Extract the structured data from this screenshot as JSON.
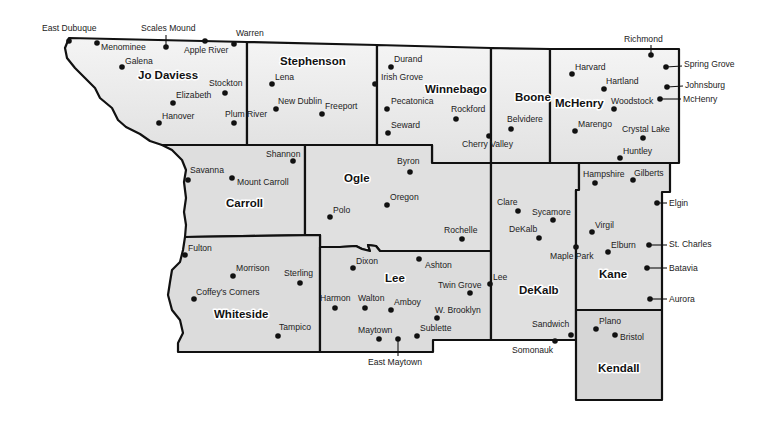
{
  "map": {
    "colors": {
      "background": "#ffffff",
      "fill_light": "#ececec",
      "fill_mid": "#dcdcdc",
      "border": "#111111",
      "text": "#222222"
    },
    "counties": [
      {
        "name": "Jo Daviess",
        "label_x": 138,
        "label_y": 79
      },
      {
        "name": "Stephenson",
        "label_x": 280,
        "label_y": 65
      },
      {
        "name": "Winnebago",
        "label_x": 425,
        "label_y": 93
      },
      {
        "name": "Boone",
        "label_x": 515,
        "label_y": 101
      },
      {
        "name": "McHenry",
        "label_x": 555,
        "label_y": 107
      },
      {
        "name": "Carroll",
        "label_x": 226,
        "label_y": 207
      },
      {
        "name": "Ogle",
        "label_x": 344,
        "label_y": 182
      },
      {
        "name": "Whiteside",
        "label_x": 214,
        "label_y": 318
      },
      {
        "name": "Lee",
        "label_x": 385,
        "label_y": 282
      },
      {
        "name": "DeKalb",
        "label_x": 519,
        "label_y": 294
      },
      {
        "name": "Kane",
        "label_x": 599,
        "label_y": 278
      },
      {
        "name": "Kendall",
        "label_x": 598,
        "label_y": 372
      }
    ],
    "cities": [
      {
        "name": "East Dubuque",
        "dot_x": 69,
        "dot_y": 41,
        "label_x": 42,
        "label_y": 31,
        "leader": true
      },
      {
        "name": "Menominee",
        "dot_x": 97,
        "dot_y": 43,
        "label_x": 101,
        "label_y": 50
      },
      {
        "name": "Scales Mound",
        "dot_x": 166,
        "dot_y": 47,
        "label_x": 141,
        "label_y": 31,
        "leader": true
      },
      {
        "name": "Apple River",
        "dot_x": 205,
        "dot_y": 41,
        "label_x": 184,
        "label_y": 53
      },
      {
        "name": "Warren",
        "dot_x": 234,
        "dot_y": 44,
        "label_x": 236,
        "label_y": 36
      },
      {
        "name": "Galena",
        "dot_x": 122,
        "dot_y": 67,
        "label_x": 125,
        "label_y": 64
      },
      {
        "name": "Stockton",
        "dot_x": 225,
        "dot_y": 93,
        "label_x": 209,
        "label_y": 86
      },
      {
        "name": "Elizabeth",
        "dot_x": 173,
        "dot_y": 103,
        "label_x": 176,
        "label_y": 98
      },
      {
        "name": "Hanover",
        "dot_x": 159,
        "dot_y": 123,
        "label_x": 162,
        "label_y": 119
      },
      {
        "name": "Plum River",
        "dot_x": 234,
        "dot_y": 123,
        "label_x": 225,
        "label_y": 117
      },
      {
        "name": "Lena",
        "dot_x": 272,
        "dot_y": 84,
        "label_x": 275,
        "label_y": 80
      },
      {
        "name": "New Dublin",
        "dot_x": 276,
        "dot_y": 109,
        "label_x": 278,
        "label_y": 104
      },
      {
        "name": "Freeport",
        "dot_x": 322,
        "dot_y": 114,
        "label_x": 325,
        "label_y": 109
      },
      {
        "name": "Durand",
        "dot_x": 391,
        "dot_y": 67,
        "label_x": 394,
        "label_y": 62
      },
      {
        "name": "Irish Grove",
        "dot_x": 375,
        "dot_y": 84,
        "label_x": 381,
        "label_y": 80
      },
      {
        "name": "Pecatonica",
        "dot_x": 387,
        "dot_y": 109,
        "label_x": 391,
        "label_y": 104
      },
      {
        "name": "Rockford",
        "dot_x": 456,
        "dot_y": 119,
        "label_x": 451,
        "label_y": 112
      },
      {
        "name": "Seward",
        "dot_x": 388,
        "dot_y": 133,
        "label_x": 391,
        "label_y": 128
      },
      {
        "name": "Cherry Valley",
        "dot_x": 489,
        "dot_y": 136,
        "label_x": 462,
        "label_y": 147
      },
      {
        "name": "Belvidere",
        "dot_x": 511,
        "dot_y": 129,
        "label_x": 507,
        "label_y": 122
      },
      {
        "name": "Richmond",
        "dot_x": 651,
        "dot_y": 55,
        "label_x": 624,
        "label_y": 42,
        "leader": true
      },
      {
        "name": "Harvard",
        "dot_x": 572,
        "dot_y": 74,
        "label_x": 575,
        "label_y": 70
      },
      {
        "name": "Spring Grove",
        "dot_x": 666,
        "dot_y": 67,
        "label_x": 684,
        "label_y": 67,
        "leader": true
      },
      {
        "name": "Hartland",
        "dot_x": 604,
        "dot_y": 89,
        "label_x": 606,
        "label_y": 84
      },
      {
        "name": "Johnsburg",
        "dot_x": 667,
        "dot_y": 87,
        "label_x": 685,
        "label_y": 88,
        "leader": true
      },
      {
        "name": "Woodstock",
        "dot_x": 614,
        "dot_y": 109,
        "label_x": 611,
        "label_y": 104
      },
      {
        "name": "McHenry",
        "dot_x": 660,
        "dot_y": 99,
        "label_x": 683,
        "label_y": 102,
        "leader": true
      },
      {
        "name": "Marengo",
        "dot_x": 575,
        "dot_y": 131,
        "label_x": 578,
        "label_y": 127
      },
      {
        "name": "Crystal Lake",
        "dot_x": 643,
        "dot_y": 138,
        "label_x": 622,
        "label_y": 132
      },
      {
        "name": "Huntley",
        "dot_x": 620,
        "dot_y": 158,
        "label_x": 623,
        "label_y": 154
      },
      {
        "name": "Shannon",
        "dot_x": 293,
        "dot_y": 161,
        "label_x": 266,
        "label_y": 157
      },
      {
        "name": "Savanna",
        "dot_x": 188,
        "dot_y": 180,
        "label_x": 190,
        "label_y": 173
      },
      {
        "name": "Mount Carroll",
        "dot_x": 232,
        "dot_y": 178,
        "label_x": 237,
        "label_y": 185
      },
      {
        "name": "Byron",
        "dot_x": 410,
        "dot_y": 172,
        "label_x": 397,
        "label_y": 164
      },
      {
        "name": "Oregon",
        "dot_x": 387,
        "dot_y": 205,
        "label_x": 390,
        "label_y": 200
      },
      {
        "name": "Polo",
        "dot_x": 330,
        "dot_y": 217,
        "label_x": 333,
        "label_y": 213
      },
      {
        "name": "Rochelle",
        "dot_x": 462,
        "dot_y": 239,
        "label_x": 444,
        "label_y": 233
      },
      {
        "name": "Clare",
        "dot_x": 518,
        "dot_y": 211,
        "label_x": 497,
        "label_y": 205
      },
      {
        "name": "Sycamore",
        "dot_x": 553,
        "dot_y": 220,
        "label_x": 532,
        "label_y": 215
      },
      {
        "name": "DeKalb",
        "dot_x": 539,
        "dot_y": 238,
        "label_x": 509,
        "label_y": 232
      },
      {
        "name": "Maple Park",
        "dot_x": 576,
        "dot_y": 247,
        "label_x": 550,
        "label_y": 259
      },
      {
        "name": "Hampshire",
        "dot_x": 595,
        "dot_y": 183,
        "label_x": 583,
        "label_y": 177
      },
      {
        "name": "Gilberts",
        "dot_x": 633,
        "dot_y": 180,
        "label_x": 634,
        "label_y": 176
      },
      {
        "name": "Elgin",
        "dot_x": 657,
        "dot_y": 203,
        "label_x": 669,
        "label_y": 206,
        "leader": true
      },
      {
        "name": "Virgil",
        "dot_x": 592,
        "dot_y": 232,
        "label_x": 595,
        "label_y": 228
      },
      {
        "name": "Elburn",
        "dot_x": 608,
        "dot_y": 252,
        "label_x": 611,
        "label_y": 248
      },
      {
        "name": "St. Charles",
        "dot_x": 649,
        "dot_y": 245,
        "label_x": 669,
        "label_y": 247,
        "leader": true
      },
      {
        "name": "Batavia",
        "dot_x": 647,
        "dot_y": 268,
        "label_x": 669,
        "label_y": 271,
        "leader": true
      },
      {
        "name": "Aurora",
        "dot_x": 650,
        "dot_y": 299,
        "label_x": 669,
        "label_y": 302,
        "leader": true
      },
      {
        "name": "Fulton",
        "dot_x": 185,
        "dot_y": 255,
        "label_x": 188,
        "label_y": 251
      },
      {
        "name": "Morrison",
        "dot_x": 233,
        "dot_y": 276,
        "label_x": 236,
        "label_y": 271
      },
      {
        "name": "Sterling",
        "dot_x": 300,
        "dot_y": 283,
        "label_x": 284,
        "label_y": 276
      },
      {
        "name": "Coffey's Corners",
        "dot_x": 194,
        "dot_y": 299,
        "label_x": 196,
        "label_y": 295
      },
      {
        "name": "Tampico",
        "dot_x": 278,
        "dot_y": 336,
        "label_x": 279,
        "label_y": 330
      },
      {
        "name": "Dixon",
        "dot_x": 353,
        "dot_y": 268,
        "label_x": 356,
        "label_y": 264
      },
      {
        "name": "Ashton",
        "dot_x": 419,
        "dot_y": 259,
        "label_x": 425,
        "label_y": 268
      },
      {
        "name": "Harmon",
        "dot_x": 335,
        "dot_y": 308,
        "label_x": 320,
        "label_y": 301
      },
      {
        "name": "Walton",
        "dot_x": 365,
        "dot_y": 308,
        "label_x": 358,
        "label_y": 301
      },
      {
        "name": "Amboy",
        "dot_x": 391,
        "dot_y": 310,
        "label_x": 394,
        "label_y": 305
      },
      {
        "name": "Twin Grove",
        "dot_x": 470,
        "dot_y": 293,
        "label_x": 438,
        "label_y": 288
      },
      {
        "name": "Lee",
        "dot_x": 490,
        "dot_y": 284,
        "label_x": 493,
        "label_y": 280
      },
      {
        "name": "W. Brooklyn",
        "dot_x": 437,
        "dot_y": 318,
        "label_x": 435,
        "label_y": 313
      },
      {
        "name": "Maytown",
        "dot_x": 379,
        "dot_y": 339,
        "label_x": 358,
        "label_y": 333
      },
      {
        "name": "East Maytown",
        "dot_x": 398,
        "dot_y": 339,
        "label_x": 368,
        "label_y": 365,
        "leader": true
      },
      {
        "name": "Sublette",
        "dot_x": 417,
        "dot_y": 336,
        "label_x": 420,
        "label_y": 331
      },
      {
        "name": "Sandwich",
        "dot_x": 571,
        "dot_y": 335,
        "label_x": 532,
        "label_y": 327
      },
      {
        "name": "Somonauk",
        "dot_x": 555,
        "dot_y": 341,
        "label_x": 512,
        "label_y": 353
      },
      {
        "name": "Plano",
        "dot_x": 596,
        "dot_y": 329,
        "label_x": 599,
        "label_y": 324
      },
      {
        "name": "Bristol",
        "dot_x": 615,
        "dot_y": 335,
        "label_x": 620,
        "label_y": 340
      }
    ]
  }
}
